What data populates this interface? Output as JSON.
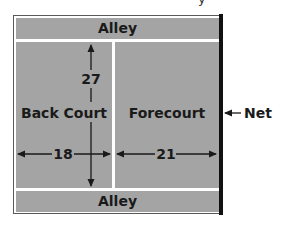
{
  "diagram": {
    "title_fragment": "y",
    "court": {
      "top_alley_label": "Alley",
      "bottom_alley_label": "Alley",
      "back_court_label": "Back Court",
      "forecourt_label": "Forecourt",
      "net_label": "Net"
    },
    "dimensions": {
      "length_label": "27",
      "back_court_width_label": "18",
      "forecourt_width_label": "21"
    },
    "colors": {
      "court_fill": "#a4a4a4",
      "lines": "#ffffff",
      "net": "#111111",
      "text": "#1a1a1a"
    }
  }
}
